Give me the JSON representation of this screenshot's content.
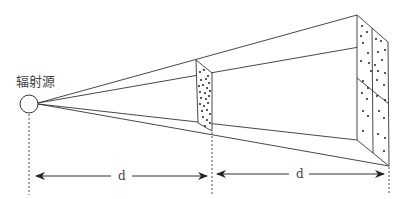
{
  "diagram": {
    "type": "inverse-square-law",
    "source_label": "辐射源",
    "distance_labels": [
      "d",
      "d"
    ],
    "colors": {
      "line": "#333333",
      "dot": "#222222",
      "label": "#444444"
    }
  }
}
